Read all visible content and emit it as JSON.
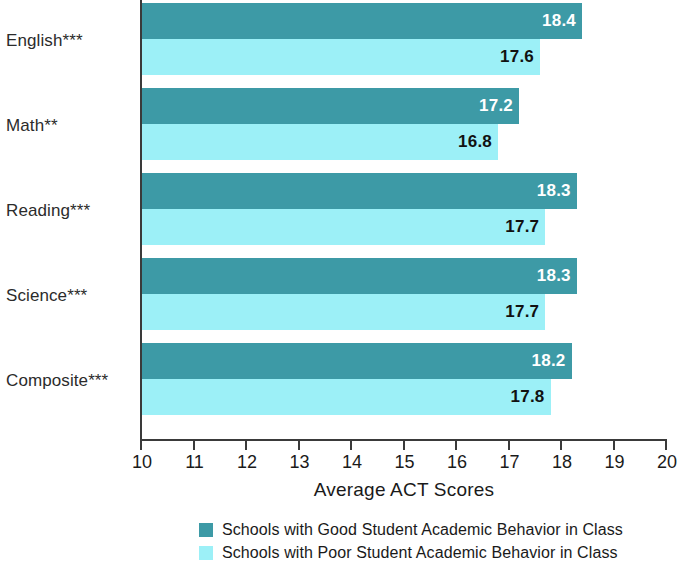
{
  "chart_data": {
    "type": "bar",
    "orientation": "horizontal",
    "title": "",
    "xlabel": "Average ACT Scores",
    "ylabel": "",
    "xlim": [
      10,
      20
    ],
    "xticks": [
      "10",
      "11",
      "12",
      "13",
      "14",
      "15",
      "16",
      "17",
      "18",
      "19",
      "20"
    ],
    "grid": false,
    "legend_position": "bottom",
    "categories": [
      "English***",
      "Math**",
      "Reading***",
      "Science***",
      "Composite***"
    ],
    "series": [
      {
        "name": "Schools with Good Student Academic Behavior in Class",
        "color": "#3d9aa6",
        "values": [
          18.4,
          17.2,
          18.3,
          18.3,
          18.2
        ],
        "labels": [
          "18.4",
          "17.2",
          "18.3",
          "18.3",
          "18.2"
        ]
      },
      {
        "name": "Schools with Poor Student Academic Behavior in Class",
        "color": "#9cf0f7",
        "values": [
          17.6,
          16.8,
          17.7,
          17.7,
          17.8
        ],
        "labels": [
          "17.6",
          "16.8",
          "17.7",
          "17.7",
          "17.8"
        ]
      }
    ]
  },
  "axis": {
    "title": "Average ACT Scores",
    "ticks": [
      "10",
      "11",
      "12",
      "13",
      "14",
      "15",
      "16",
      "17",
      "18",
      "19",
      "20"
    ]
  },
  "categories": [
    {
      "label": "English***"
    },
    {
      "label": "Math**"
    },
    {
      "label": "Reading***"
    },
    {
      "label": "Science***"
    },
    {
      "label": "Composite***"
    }
  ],
  "legend": [
    {
      "label": "Schools with Good Student Academic Behavior in Class",
      "color": "#3d9aa6"
    },
    {
      "label": "Schools with Poor Student Academic Behavior in Class",
      "color": "#9cf0f7"
    }
  ]
}
